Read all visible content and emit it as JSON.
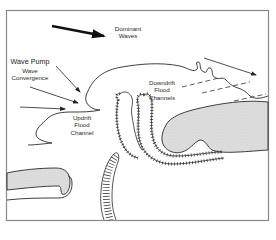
{
  "labels": {
    "dominant_waves": [
      "Dominant",
      "Waves"
    ],
    "wave_pump": "Wave Pump",
    "wave_convergence": [
      "Wave",
      "Convergence"
    ],
    "updrift": [
      "Updrift",
      "Flood",
      "Channel"
    ],
    "downdrift": [
      "Downdrift",
      "Flood",
      "Channels"
    ]
  },
  "colors": {
    "frame": "#8a8a8a",
    "ink": "#2a2a2a",
    "land_fill": "#dcdcdc",
    "background": "#ffffff"
  }
}
